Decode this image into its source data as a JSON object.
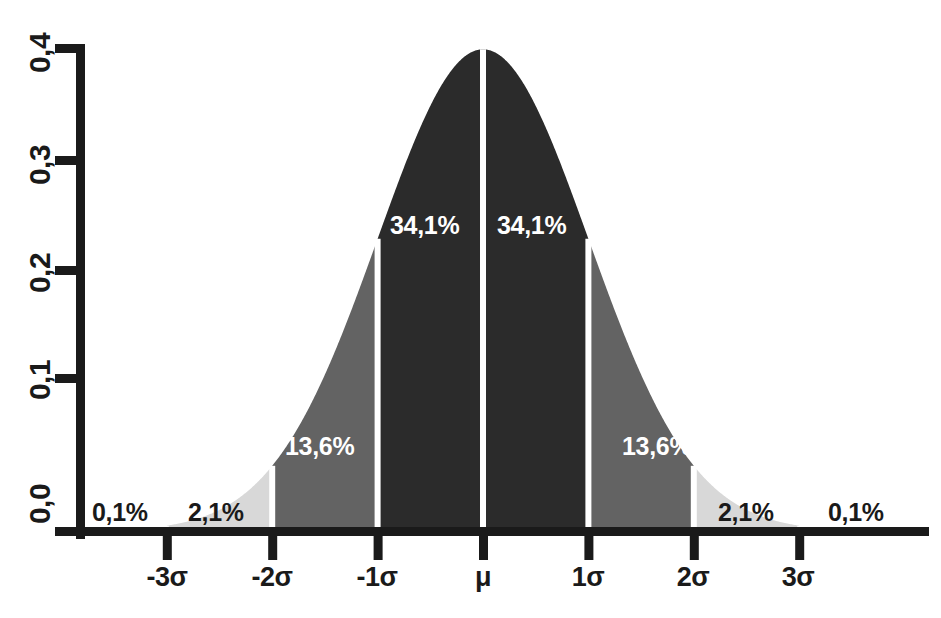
{
  "chart_data": {
    "type": "area",
    "title": "",
    "xlabel": "",
    "ylabel": "",
    "distribution": "normal",
    "mean": 0,
    "sigma": 1,
    "xlim": [
      -4.0,
      4.0
    ],
    "ylim": [
      0.0,
      0.4
    ],
    "grid": false,
    "legend": null,
    "x_tick_values": [
      -3,
      -2,
      -1,
      0,
      1,
      2,
      3
    ],
    "x_tick_labels": [
      "-3σ",
      "-2σ",
      "-1σ",
      "μ",
      "1σ",
      "2σ",
      "3σ"
    ],
    "y_tick_values": [
      0.0,
      0.1,
      0.2,
      0.3,
      0.4
    ],
    "y_tick_labels": [
      "0,0",
      "0,1",
      "0,2",
      "0,3",
      "0,4"
    ],
    "bands": [
      {
        "name": "tail-left-outer",
        "from": -4,
        "to": -3,
        "label": "0,1%",
        "value": 0.1,
        "fill": "#ffffff",
        "label_color": "#1a1a1a"
      },
      {
        "name": "band-left-3",
        "from": -3,
        "to": -2,
        "label": "2,1%",
        "value": 2.1,
        "fill": "#d8d8d8",
        "label_color": "#1a1a1a"
      },
      {
        "name": "band-left-2",
        "from": -2,
        "to": -1,
        "label": "13,6%",
        "value": 13.6,
        "fill": "#636363",
        "label_color": "#ffffff"
      },
      {
        "name": "band-left-1",
        "from": -1,
        "to": 0,
        "label": "34,1%",
        "value": 34.1,
        "fill": "#2b2b2b",
        "label_color": "#ffffff"
      },
      {
        "name": "band-right-1",
        "from": 0,
        "to": 1,
        "label": "34,1%",
        "value": 34.1,
        "fill": "#2b2b2b",
        "label_color": "#ffffff"
      },
      {
        "name": "band-right-2",
        "from": 1,
        "to": 2,
        "label": "13,6%",
        "value": 13.6,
        "fill": "#636363",
        "label_color": "#ffffff"
      },
      {
        "name": "band-right-3",
        "from": 2,
        "to": 3,
        "label": "2,1%",
        "value": 2.1,
        "fill": "#d8d8d8",
        "label_color": "#1a1a1a"
      },
      {
        "name": "tail-right-outer",
        "from": 3,
        "to": 4,
        "label": "0,1%",
        "value": 0.1,
        "fill": "#ffffff",
        "label_color": "#1a1a1a"
      }
    ]
  },
  "yaxis": {
    "ticks": [
      {
        "label": "0,4"
      },
      {
        "label": "0,3"
      },
      {
        "label": "0,2"
      },
      {
        "label": "0,1"
      },
      {
        "label": "0,0"
      }
    ]
  },
  "xaxis": {
    "ticks": [
      {
        "label": "-3σ"
      },
      {
        "label": "-2σ"
      },
      {
        "label": "-1σ"
      },
      {
        "label": "μ"
      },
      {
        "label": "1σ"
      },
      {
        "label": "2σ"
      },
      {
        "label": "3σ"
      }
    ]
  },
  "regions": {
    "left_tail_outer": "0,1%",
    "left_band_3": "2,1%",
    "left_band_2": "13,6%",
    "left_band_1": "34,1%",
    "right_band_1": "34,1%",
    "right_band_2": "13,6%",
    "right_band_3": "2,1%",
    "right_tail_outer": "0,1%"
  },
  "colors": {
    "axis": "#1a1a1a",
    "core_fill": "#2b2b2b",
    "mid_fill": "#636363",
    "outer_fill": "#d8d8d8",
    "divider": "#ffffff",
    "background": "#ffffff"
  }
}
